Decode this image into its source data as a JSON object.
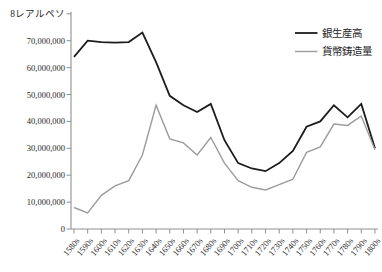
{
  "figure": {
    "background": "#ffffff"
  },
  "chart_data": {
    "type": "line",
    "title": "",
    "xlabel": "",
    "ylabel": "",
    "unit_label": "8レアルペソ",
    "ylim": [
      0,
      80000000
    ],
    "ytick_step": 10000000,
    "ytick_labels": [
      "0",
      "10,000,000",
      "20,000,000",
      "30,000,000",
      "40,000,000",
      "50,000,000",
      "60,000,000",
      "70,000,000",
      "8レアルペソ"
    ],
    "grid": false,
    "legend_position": "top-right",
    "categories": [
      "1580s",
      "1590s",
      "1600s",
      "1610s",
      "1620s",
      "1630s",
      "1640s",
      "1650s",
      "1660s",
      "1670s",
      "1680s",
      "1690s",
      "1700s",
      "1710s",
      "1720s",
      "1730s",
      "1740s",
      "1750s",
      "1760s",
      "1770s",
      "1780s",
      "1790s",
      "1800s"
    ],
    "series": [
      {
        "name": "銀生産高",
        "color": "#1c1c1c",
        "stroke_width": 1.8,
        "values": [
          64000000,
          70000000,
          69500000,
          69300000,
          69500000,
          73000000,
          62000000,
          49500000,
          46000000,
          43500000,
          46500000,
          33000000,
          24500000,
          22500000,
          21500000,
          24500000,
          29000000,
          38000000,
          40000000,
          46000000,
          41500000,
          46500000,
          30000000
        ]
      },
      {
        "name": "貨幣鋳造量",
        "color": "#9c9c9c",
        "stroke_width": 1.4,
        "values": [
          8000000,
          6000000,
          12500000,
          16000000,
          18000000,
          27500000,
          46000000,
          33500000,
          32000000,
          27500000,
          34000000,
          24500000,
          18000000,
          15500000,
          14500000,
          16500000,
          18500000,
          28500000,
          30500000,
          39000000,
          38500000,
          42000000,
          29500000
        ]
      }
    ],
    "colors": {
      "axis": "#8f8f8f",
      "text": "#1f1f1f"
    }
  }
}
